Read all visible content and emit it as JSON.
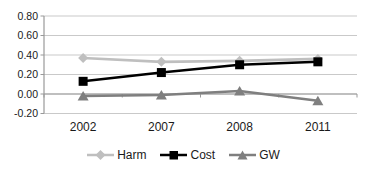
{
  "chart_data": {
    "type": "line",
    "title": "",
    "categories": [
      "2002",
      "2007",
      "2008",
      "2011"
    ],
    "series": [
      {
        "name": "Harm",
        "marker": "diamond",
        "color": "#bfbfbf",
        "values": [
          0.37,
          0.33,
          0.34,
          0.36
        ]
      },
      {
        "name": "Cost",
        "marker": "square",
        "color": "#000000",
        "values": [
          0.13,
          0.22,
          0.3,
          0.33
        ]
      },
      {
        "name": "GW",
        "marker": "triangle",
        "color": "#7f7f7f",
        "values": [
          -0.02,
          -0.01,
          0.03,
          -0.07
        ]
      }
    ],
    "xlabel": "",
    "ylabel": "",
    "ylim": [
      -0.2,
      0.8
    ],
    "ytick_step": 0.2,
    "ytick_labels": [
      "0.80",
      "0.60",
      "0.40",
      "0.20",
      "0.00",
      "-0.20"
    ],
    "grid": true,
    "legend_position": "bottom"
  },
  "colors": {
    "background": "#ffffff",
    "gridline": "#c9c9c9",
    "axis": "#999999",
    "label_text": "#1a1a1a"
  }
}
